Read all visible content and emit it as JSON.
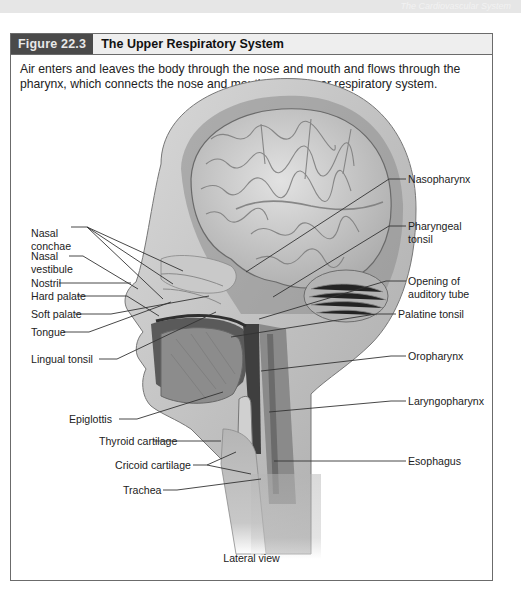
{
  "page": {
    "header_faint_text": "The Cardiovascular System"
  },
  "figure": {
    "number": "Figure 22.3",
    "title": "The Upper Respiratory System",
    "caption": "Air enters and leaves the body through the nose and mouth and flows through the pharynx, which connects the nose and mouth to the lower respiratory system.",
    "view_label": "Lateral view",
    "colors": {
      "frame_border": "#6b6b6b",
      "tag_background": "#4a4a4a",
      "header_background": "#eeeeee"
    }
  },
  "labels_left": [
    {
      "id": "nasal-conchae",
      "text": "Nasal\nconchae"
    },
    {
      "id": "nasal-vestibule",
      "text": "Nasal\nvestibule"
    },
    {
      "id": "nostril",
      "text": "Nostril"
    },
    {
      "id": "hard-palate",
      "text": "Hard palate"
    },
    {
      "id": "soft-palate",
      "text": "Soft palate"
    },
    {
      "id": "tongue",
      "text": "Tongue"
    },
    {
      "id": "lingual-tonsil",
      "text": "Lingual tonsil"
    },
    {
      "id": "epiglottis",
      "text": "Epiglottis"
    },
    {
      "id": "thyroid-cartilage",
      "text": "Thyroid cartilage"
    },
    {
      "id": "cricoid-cartilage",
      "text": "Cricoid cartilage"
    },
    {
      "id": "trachea",
      "text": "Trachea"
    }
  ],
  "labels_right": [
    {
      "id": "nasopharynx",
      "text": "Nasopharynx"
    },
    {
      "id": "pharyngeal-tonsil",
      "text": "Pharyngeal\ntonsil"
    },
    {
      "id": "opening-of-auditory-tube",
      "text": "Opening of\nauditory tube"
    },
    {
      "id": "palatine-tonsil",
      "text": "Palatine tonsil"
    },
    {
      "id": "oropharynx",
      "text": "Oropharynx"
    },
    {
      "id": "laryngopharynx",
      "text": "Laryngopharynx"
    },
    {
      "id": "esophagus",
      "text": "Esophagus"
    }
  ]
}
